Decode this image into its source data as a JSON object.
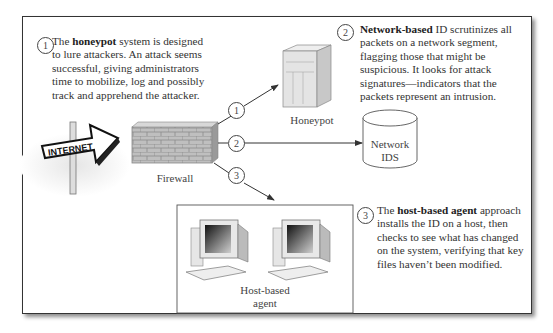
{
  "diagram": {
    "type": "network-intrusion-detection",
    "callouts": [
      {
        "number": "1",
        "pre": "The ",
        "bold": "honeypot",
        "post": " system is designed",
        "lines": [
          "to lure attackers. An attack seems",
          "successful, giving administrators",
          "time to mobilize, log and possibly",
          "track and apprehend the attacker."
        ]
      },
      {
        "number": "2",
        "pre": "",
        "bold": "Network-based",
        "post": " ID scrutinizes all",
        "lines": [
          "packets on a network segment,",
          "flagging those that might be",
          "suspicious. It looks for attack",
          "signatures—indicators that the",
          "packets represent an intrusion."
        ]
      },
      {
        "number": "3",
        "pre": "The ",
        "bold": "host-based agent",
        "post": " approach",
        "lines": [
          "installs the ID on a host, then",
          "checks to see what has changed",
          "on the system, verifying that key",
          "files haven’t been modified."
        ]
      }
    ],
    "nodes": {
      "internet": "INTERNET",
      "firewall": "Firewall",
      "honeypot": "Honeypot",
      "network_ids_line1": "Network",
      "network_ids_line2": "IDS",
      "host_agent_line1": "Host-based",
      "host_agent_line2": "agent"
    },
    "connector_numbers": [
      "1",
      "2",
      "3"
    ]
  }
}
